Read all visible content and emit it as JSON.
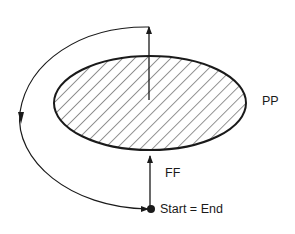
{
  "diagram": {
    "labels": {
      "region": "PP",
      "inbound_arrow": "FF",
      "start_end": "Start = End"
    },
    "colors": {
      "stroke": "#1a1a1a",
      "background": "#ffffff"
    }
  }
}
